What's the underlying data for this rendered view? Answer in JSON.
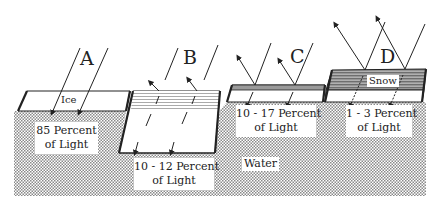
{
  "diagram": {
    "type": "light-penetration-through-ice-cover",
    "panels": [
      {
        "id": "A",
        "label": "A",
        "surface": "Ice",
        "surface_label": "Ice",
        "transmission": "85 Percent",
        "transmission_line2": "of Light"
      },
      {
        "id": "B",
        "label": "B",
        "surface": "Slush ice",
        "transmission": "10 - 12 Percent",
        "transmission_line2": "of Light"
      },
      {
        "id": "C",
        "label": "C",
        "surface": "Thin ice layer",
        "transmission": "10 - 17 Percent",
        "transmission_line2": "of Light"
      },
      {
        "id": "D",
        "label": "D",
        "surface": "Snow",
        "surface_label": "Snow",
        "transmission": "1 - 3 Percent",
        "transmission_line2": "of Light"
      }
    ],
    "medium_label": "Water",
    "colors": {
      "line": "#222222",
      "stipple": "#9a9a9a",
      "background": "#ffffff",
      "snow": "#8c8c8c"
    }
  }
}
